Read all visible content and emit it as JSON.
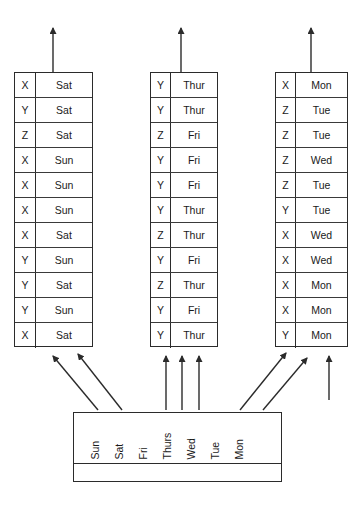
{
  "diagram": {
    "tables": [
      {
        "id": "table-left",
        "rows": [
          {
            "key": "X",
            "day": "Sat"
          },
          {
            "key": "Y",
            "day": "Sat"
          },
          {
            "key": "Z",
            "day": "Sat"
          },
          {
            "key": "X",
            "day": "Sun"
          },
          {
            "key": "X",
            "day": "Sun"
          },
          {
            "key": "X",
            "day": "Sun"
          },
          {
            "key": "X",
            "day": "Sat"
          },
          {
            "key": "Y",
            "day": "Sun"
          },
          {
            "key": "Y",
            "day": "Sat"
          },
          {
            "key": "Y",
            "day": "Sun"
          },
          {
            "key": "X",
            "day": "Sat"
          }
        ]
      },
      {
        "id": "table-middle",
        "rows": [
          {
            "key": "Y",
            "day": "Thur"
          },
          {
            "key": "Y",
            "day": "Thur"
          },
          {
            "key": "Z",
            "day": "Fri"
          },
          {
            "key": "Y",
            "day": "Fri"
          },
          {
            "key": "Y",
            "day": "Fri"
          },
          {
            "key": "Y",
            "day": "Thur"
          },
          {
            "key": "Z",
            "day": "Thur"
          },
          {
            "key": "Y",
            "day": "Fri"
          },
          {
            "key": "Z",
            "day": "Thur"
          },
          {
            "key": "Y",
            "day": "Fri"
          },
          {
            "key": "Y",
            "day": "Thur"
          }
        ]
      },
      {
        "id": "table-right",
        "rows": [
          {
            "key": "X",
            "day": "Mon"
          },
          {
            "key": "Z",
            "day": "Tue"
          },
          {
            "key": "Z",
            "day": "Tue"
          },
          {
            "key": "Z",
            "day": "Wed"
          },
          {
            "key": "Z",
            "day": "Tue"
          },
          {
            "key": "Y",
            "day": "Tue"
          },
          {
            "key": "X",
            "day": "Wed"
          },
          {
            "key": "X",
            "day": "Wed"
          },
          {
            "key": "X",
            "day": "Mon"
          },
          {
            "key": "X",
            "day": "Mon"
          },
          {
            "key": "Y",
            "day": "Mon"
          }
        ]
      }
    ],
    "source_box": {
      "id": "source-bucket-box",
      "labels": [
        "Sun",
        "Sat",
        "Fri",
        "Thurs",
        "Wed",
        "Tue",
        "Mon"
      ]
    },
    "colors": {
      "stroke": "#2b2b2b",
      "text": "#1a1a1a",
      "background": "#ffffff"
    }
  }
}
